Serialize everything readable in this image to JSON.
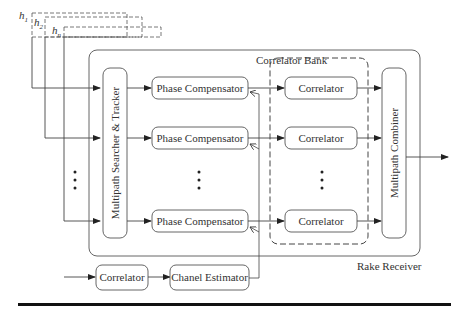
{
  "diagram": {
    "title": "Rake Receiver",
    "inputs": {
      "h1": "h",
      "h1_sub": "1",
      "h2": "h",
      "h2_sub": "2",
      "hn": "h",
      "hn_sub": "n"
    },
    "correlator_bank_label": "Correlator Bank",
    "rake_receiver_label": "Rake Receiver",
    "searcher_label": "Multipath Searcher & Tracker",
    "combiner_label": "Multipath Combiner",
    "phase_compensators": [
      {
        "label": "Phase Compensator"
      },
      {
        "label": "Phase Compensator"
      },
      {
        "label": "Phase Compensator"
      }
    ],
    "correlators": [
      {
        "label": "Correlator"
      },
      {
        "label": "Correlator"
      },
      {
        "label": "Correlator"
      }
    ],
    "bottom_correlator_label": "Correlator",
    "channel_estimator_label": "Chanel Estimator"
  }
}
